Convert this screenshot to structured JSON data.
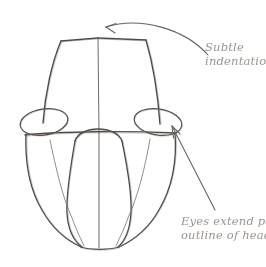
{
  "canvas": {
    "width": 266,
    "height": 267,
    "background": "#ffffff",
    "title": "Head construction sketch - front view"
  },
  "sketch": {
    "medium": "pencil drawing",
    "subject": "animal head front view construction lines",
    "stroke_color": "#5a5450",
    "light_stroke_color": "#8d8884",
    "parts": [
      {
        "name": "head-outline",
        "label": "outline of head"
      },
      {
        "name": "center-line",
        "label": "vertical center line"
      },
      {
        "name": "top-indentation",
        "label": "subtle indentation at top of skull"
      },
      {
        "name": "brow-line",
        "label": "horizontal brow line"
      },
      {
        "name": "left-eye",
        "label": "left eye ellipse"
      },
      {
        "name": "right-eye",
        "label": "right eye ellipse"
      },
      {
        "name": "muzzle",
        "label": "muzzle / snout block"
      }
    ]
  },
  "annotations": [
    {
      "id": "subtle-indentation",
      "line1": "Subtle",
      "line2": "indentation",
      "color": "#9a9490",
      "arrow": "curved-arrow-pointing-left-to-top-of-head"
    },
    {
      "id": "eyes-extend-past",
      "line1": "Eyes extend past",
      "line2": "outline of head",
      "color": "#9a9490",
      "arrow": "straight-arrow-pointing-up-left-to-right-eye"
    }
  ]
}
